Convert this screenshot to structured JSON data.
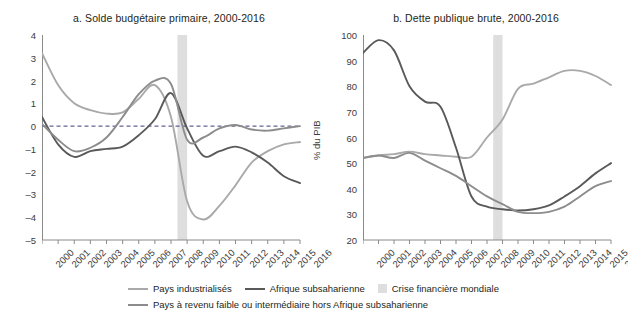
{
  "figure": {
    "panels": [
      {
        "id": "a",
        "title": "a. Solde budgétaire primaire, 2000-2016"
      },
      {
        "id": "b",
        "title": "b. Dette publique brute, 2000-2016"
      }
    ]
  },
  "legend": {
    "items": [
      {
        "label": "Pays industrialisés",
        "marker": "line",
        "color": "#a9a9a9"
      },
      {
        "label": "Afrique subsaharienne",
        "marker": "line",
        "color": "#595959"
      },
      {
        "label": "Crise financière mondiale",
        "marker": "box",
        "color": "#dedede"
      },
      {
        "label": "Pays à revenu faible ou intermédiaire hors Afrique subsaharienne",
        "marker": "line",
        "color": "#8c8c8c"
      }
    ]
  },
  "chart_data": [
    {
      "type": "line",
      "panel": "a",
      "title": "a. Solde budgétaire primaire, 2000-2016",
      "xlabel": "",
      "ylabel": "% du PIB",
      "x": [
        2000,
        2001,
        2002,
        2003,
        2004,
        2005,
        2006,
        2007,
        2008,
        2009,
        2010,
        2011,
        2012,
        2013,
        2014,
        2015,
        2016
      ],
      "xtick_labels": [
        "2000",
        "2001",
        "2002",
        "2003",
        "2004",
        "2005",
        "2006",
        "2007",
        "2008",
        "2009",
        "2010",
        "2011",
        "2012",
        "2013",
        "2014",
        "2015",
        "2016"
      ],
      "ylim": [
        -5,
        4
      ],
      "ytick_labels": [
        "4",
        "3",
        "2",
        "1",
        "0",
        "-1",
        "-2",
        "-3",
        "-4",
        "-5"
      ],
      "yticks": [
        4,
        3,
        2,
        1,
        0,
        -1,
        -2,
        -3,
        -4,
        -5
      ],
      "grid": false,
      "zero_reference_line": 0,
      "highlight_band": {
        "label": "Crise financière mondiale",
        "from": 2008.4,
        "to": 2009.0,
        "color": "#dedede"
      },
      "legend_position": "bottom",
      "series": [
        {
          "name": "Pays industrialisés",
          "color": "#a9a9a9",
          "values": [
            3.2,
            1.8,
            1.0,
            0.7,
            0.55,
            0.6,
            1.2,
            1.8,
            0.4,
            -3.3,
            -4.1,
            -3.5,
            -2.6,
            -1.6,
            -1.1,
            -0.8,
            -0.7
          ]
        },
        {
          "name": "Afrique subsaharienne",
          "color": "#595959",
          "values": [
            0.4,
            -0.8,
            -1.35,
            -1.1,
            -1.0,
            -0.9,
            -0.4,
            0.3,
            1.45,
            -0.1,
            -1.3,
            -1.1,
            -0.9,
            -1.15,
            -1.6,
            -2.2,
            -2.5
          ]
        },
        {
          "name": "Pays à revenu faible ou intermédiaire hors Afrique subsaharienne",
          "color": "#8c8c8c",
          "values": [
            0.1,
            -0.6,
            -1.1,
            -0.95,
            -0.5,
            0.4,
            1.4,
            2.0,
            1.85,
            -0.6,
            -0.5,
            -0.1,
            0.05,
            -0.15,
            -0.2,
            -0.1,
            0.0
          ]
        }
      ]
    },
    {
      "type": "line",
      "panel": "b",
      "title": "b. Dette publique brute, 2000-2016",
      "xlabel": "",
      "ylabel": "% du PIB",
      "x": [
        2000,
        2001,
        2002,
        2003,
        2004,
        2005,
        2006,
        2007,
        2008,
        2009,
        2010,
        2011,
        2012,
        2013,
        2014,
        2015,
        2016
      ],
      "xtick_labels": [
        "2000",
        "2001",
        "2002",
        "2003",
        "2004",
        "2005",
        "2006",
        "2007",
        "2008",
        "2009",
        "2010",
        "2011",
        "2012",
        "2013",
        "2014",
        "2015",
        "2016"
      ],
      "ylim": [
        20,
        100
      ],
      "ytick_labels": [
        "100",
        "90",
        "80",
        "70",
        "60",
        "50",
        "40",
        "30",
        "20"
      ],
      "yticks": [
        100,
        90,
        80,
        70,
        60,
        50,
        40,
        30,
        20
      ],
      "grid": false,
      "highlight_band": {
        "label": "Crise financière mondiale",
        "from": 2008.4,
        "to": 2009.0,
        "color": "#dedede"
      },
      "legend_position": "bottom",
      "series": [
        {
          "name": "Pays industrialisés",
          "color": "#a9a9a9",
          "values": [
            52,
            53,
            53.5,
            54.5,
            53.5,
            53,
            52.5,
            52.5,
            60,
            67,
            79,
            81,
            83.5,
            86,
            86,
            84,
            80.5
          ]
        },
        {
          "name": "Afrique subsaharienne",
          "color": "#595959",
          "values": [
            93,
            98,
            94,
            80,
            74,
            72,
            56,
            37,
            33,
            32,
            31.5,
            32,
            33.5,
            37,
            41,
            46,
            50
          ]
        },
        {
          "name": "Pays à revenu faible ou intermédiaire hors Afrique subsaharienne",
          "color": "#8c8c8c",
          "values": [
            52,
            53,
            52,
            54,
            51,
            48,
            45,
            41,
            37,
            34,
            31,
            30.5,
            31,
            33,
            37,
            41,
            43
          ]
        }
      ]
    }
  ]
}
